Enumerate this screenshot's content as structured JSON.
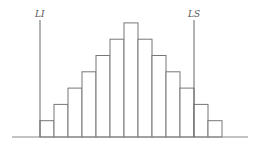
{
  "chart_data": {
    "type": "bar",
    "title": "",
    "xlabel": "",
    "ylabel": "",
    "categories": [
      "1",
      "2",
      "3",
      "4",
      "5",
      "6",
      "7",
      "8",
      "9",
      "10",
      "11",
      "12",
      "13"
    ],
    "values": [
      1,
      2,
      3,
      4,
      5,
      6,
      7,
      6,
      5,
      4,
      3,
      2,
      1
    ],
    "grid": false,
    "annotations": [
      {
        "label": "LI",
        "position_bar_index": 0,
        "edge": "left"
      },
      {
        "label": "LS",
        "position_bar_index": 11,
        "edge": "left"
      }
    ]
  },
  "labels": {
    "lower_limit": "LI",
    "upper_limit": "LS"
  },
  "colors": {
    "stroke": "#777777",
    "fill": "#ffffff"
  }
}
